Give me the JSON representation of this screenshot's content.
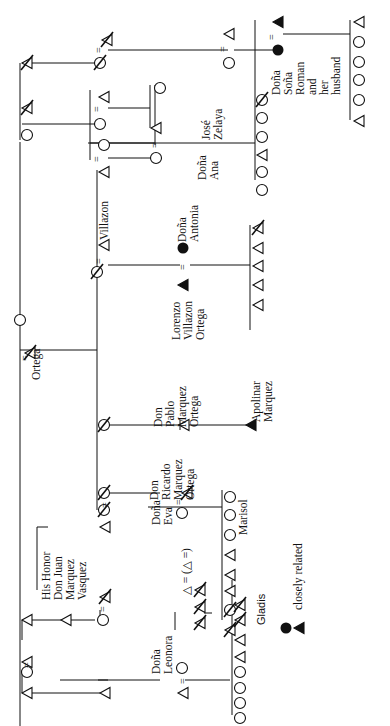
{
  "diagram": {
    "orientation": "rotated -90deg",
    "labels": {
      "ortega": "Ortega",
      "his_honor": "His Honor\nDon Juan\nMarquez\nVasquez",
      "dona_leonora": "Doña\nLeonora",
      "dona_eva": "Doña\nEva",
      "don_ricardo": "Don\nRicardo\nMarquez\nOrtega",
      "don_pablo": "Don\nPablo\nMarquez\nOrtega",
      "apolinar": "Apolinar\nMarquez",
      "lorenzo": "Lorenzo\nVillazon\nOrtega",
      "dona_antonia": "Doña\nAntonia",
      "villazon": "Villazon",
      "dona_ana": "Doña\nAna",
      "jose_zelaya": "José\nZelaya",
      "dona_sona": "Doña\nSoña\nRoman\nand\nher\nhusband",
      "marisol": "Marisol",
      "gladis": "Gladis",
      "eva_note": "△ = (△ =)",
      "legend_text": "closely related"
    },
    "legend": {
      "symbols": [
        "filled-circle",
        "filled-triangle"
      ],
      "meaning": "closely related"
    },
    "symbol_key": {
      "open_triangle": "male",
      "open_circle": "female",
      "slashed": "deceased",
      "filled": "closely related",
      "equals": "marriage"
    },
    "colors": {
      "ink": "#111111",
      "background": "#ffffff"
    }
  }
}
